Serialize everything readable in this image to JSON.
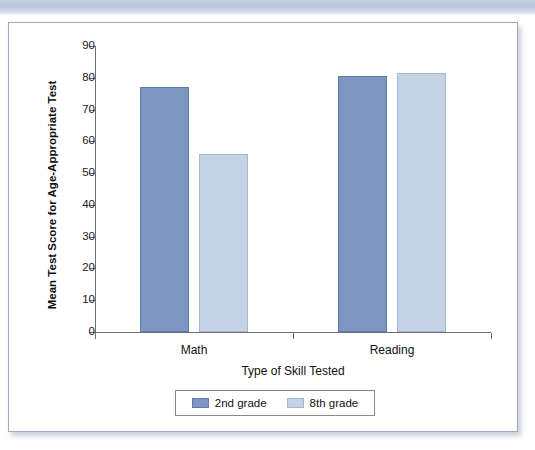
{
  "decoration": {
    "top_band_color": "#c2cbdf",
    "card_border_color": "#9aaac6"
  },
  "chart_data": {
    "type": "bar",
    "title": "",
    "subtitle": "",
    "xlabel": "Type of Skill Tested",
    "ylabel": "Mean Test Score for Age-Appropriate Test",
    "categories": [
      "Math",
      "Reading"
    ],
    "series": [
      {
        "name": "2nd grade",
        "color": "#7d95c1",
        "values": [
          77,
          80.5
        ]
      },
      {
        "name": "8th grade",
        "color": "#c5d2e6",
        "values": [
          56,
          81.5
        ]
      }
    ],
    "ylim": [
      0,
      90
    ],
    "ytick_step": 10,
    "yticks": [
      0,
      10,
      20,
      30,
      40,
      50,
      60,
      70,
      80,
      90
    ],
    "ytick_labels": [
      "0",
      "10",
      "20",
      "30",
      "40",
      "50",
      "60",
      "70",
      "80",
      "90"
    ],
    "grid": false,
    "legend_position": "bottom"
  }
}
